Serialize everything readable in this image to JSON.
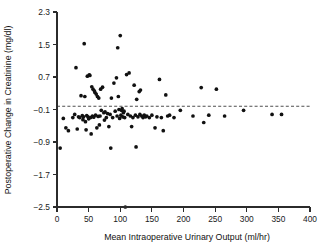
{
  "chart_data": {
    "type": "scatter",
    "title": "",
    "xlabel": "Mean Intraoperative Urinary Output (ml/hr)",
    "ylabel": "Postoperative Change in Creatinine (mg/dl)",
    "xlim": [
      0,
      400
    ],
    "ylim": [
      -2.5,
      2.3
    ],
    "xticks": [
      0,
      50,
      100,
      150,
      200,
      250,
      300,
      350,
      400
    ],
    "xtick_labels": [
      "0",
      "50",
      "100",
      "150",
      "200",
      "250",
      "300",
      "350",
      "400"
    ],
    "yticks": [
      2.3,
      1.5,
      0.7,
      -0.1,
      -0.9,
      -1.7,
      -2.5
    ],
    "ytick_labels": [
      "2.3",
      "1.5",
      "0.7",
      "−0.1",
      "−0.9",
      "−1.7",
      "−2.5"
    ],
    "grid": false,
    "legend": null,
    "marker": "filled-circle",
    "marker_color": "#111111",
    "reference_line": {
      "orientation": "horizontal",
      "value": -0.02,
      "style": "dashed",
      "color": "#3a3a3a",
      "x_start": 0,
      "x_end": 400
    },
    "n_points": 106,
    "points": [
      [
        5,
        -1.05
      ],
      [
        10,
        -0.32
      ],
      [
        14,
        -0.55
      ],
      [
        18,
        -0.62
      ],
      [
        25,
        -0.3
      ],
      [
        28,
        -0.22
      ],
      [
        30,
        0.93
      ],
      [
        32,
        -0.58
      ],
      [
        34,
        -0.28
      ],
      [
        36,
        -0.3
      ],
      [
        38,
        0.24
      ],
      [
        40,
        -0.25
      ],
      [
        41,
        -0.35
      ],
      [
        42,
        -0.28
      ],
      [
        43,
        1.52
      ],
      [
        44,
        0.22
      ],
      [
        45,
        -0.4
      ],
      [
        46,
        -0.6
      ],
      [
        47,
        -0.25
      ],
      [
        48,
        0.72
      ],
      [
        49,
        -0.28
      ],
      [
        50,
        -0.33
      ],
      [
        51,
        0.75
      ],
      [
        52,
        0.74
      ],
      [
        53,
        -0.3
      ],
      [
        54,
        -0.7
      ],
      [
        55,
        0.46
      ],
      [
        56,
        -0.26
      ],
      [
        57,
        0.4
      ],
      [
        58,
        -0.29
      ],
      [
        59,
        0.36
      ],
      [
        60,
        0.32
      ],
      [
        61,
        -0.24
      ],
      [
        62,
        0.28
      ],
      [
        63,
        -0.55
      ],
      [
        64,
        0.22
      ],
      [
        65,
        -0.27
      ],
      [
        66,
        0.18
      ],
      [
        67,
        -0.48
      ],
      [
        68,
        -0.26
      ],
      [
        69,
        0.4
      ],
      [
        70,
        -0.12
      ],
      [
        72,
        0.45
      ],
      [
        74,
        -0.18
      ],
      [
        75,
        -0.36
      ],
      [
        76,
        -0.16
      ],
      [
        78,
        -0.3
      ],
      [
        80,
        -0.2
      ],
      [
        82,
        -0.52
      ],
      [
        84,
        -0.22
      ],
      [
        85,
        -1.05
      ],
      [
        86,
        0.18
      ],
      [
        88,
        -0.3
      ],
      [
        90,
        0.55
      ],
      [
        92,
        -0.14
      ],
      [
        94,
        0.68
      ],
      [
        95,
        -0.26
      ],
      [
        96,
        1.42
      ],
      [
        97,
        0.22
      ],
      [
        98,
        -0.1
      ],
      [
        99,
        -0.32
      ],
      [
        100,
        1.72
      ],
      [
        101,
        -0.24
      ],
      [
        102,
        -0.12
      ],
      [
        103,
        -0.08
      ],
      [
        104,
        -0.28
      ],
      [
        105,
        -0.18
      ],
      [
        106,
        -0.14
      ],
      [
        107,
        -0.3
      ],
      [
        108,
        -2.5
      ],
      [
        110,
        0.76
      ],
      [
        112,
        -0.22
      ],
      [
        114,
        0.8
      ],
      [
        116,
        -0.26
      ],
      [
        118,
        -0.52
      ],
      [
        120,
        -0.3
      ],
      [
        122,
        0.5
      ],
      [
        124,
        -0.24
      ],
      [
        125,
        -1.02
      ],
      [
        126,
        0.15
      ],
      [
        128,
        -0.28
      ],
      [
        130,
        0.34
      ],
      [
        131,
        -0.22
      ],
      [
        132,
        0.38
      ],
      [
        134,
        -0.26
      ],
      [
        136,
        -0.3
      ],
      [
        138,
        -0.24
      ],
      [
        140,
        -0.28
      ],
      [
        142,
        -0.26
      ],
      [
        146,
        -0.3
      ],
      [
        150,
        -0.24
      ],
      [
        155,
        -0.55
      ],
      [
        158,
        -0.28
      ],
      [
        162,
        0.64
      ],
      [
        165,
        -0.3
      ],
      [
        168,
        -0.62
      ],
      [
        172,
        0.26
      ],
      [
        175,
        -0.26
      ],
      [
        178,
        -0.24
      ],
      [
        185,
        -0.3
      ],
      [
        195,
        -0.12
      ],
      [
        215,
        -0.26
      ],
      [
        228,
        0.44
      ],
      [
        232,
        -0.42
      ],
      [
        240,
        -0.24
      ],
      [
        252,
        0.4
      ],
      [
        265,
        -0.26
      ],
      [
        295,
        -0.12
      ],
      [
        340,
        -0.22
      ],
      [
        355,
        -0.22
      ]
    ]
  }
}
